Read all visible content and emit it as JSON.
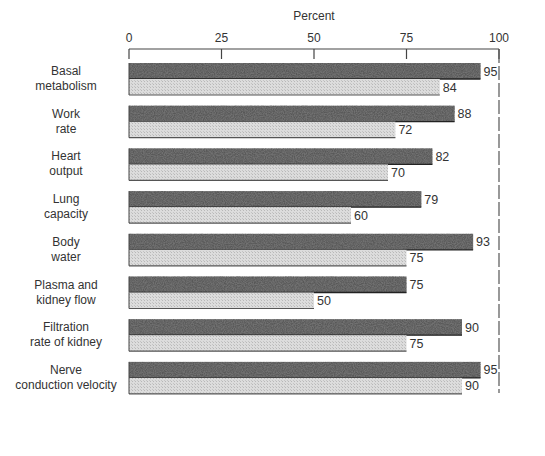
{
  "chart_data": {
    "type": "bar",
    "orientation": "horizontal",
    "title": "",
    "xlabel": "Percent",
    "ylabel": "",
    "xlim": [
      0,
      100
    ],
    "xticks": [
      "0",
      "25",
      "50",
      "75",
      "100"
    ],
    "grid": false,
    "reference_line": {
      "value": 100,
      "style": "dashed"
    },
    "categories": [
      [
        "Basal",
        "metabolism"
      ],
      [
        "Work",
        "rate"
      ],
      [
        "Heart",
        "output"
      ],
      [
        "Lung",
        "capacity"
      ],
      [
        "Body",
        "water"
      ],
      [
        "Plasma and",
        "kidney flow"
      ],
      [
        "Filtration",
        "rate of kidney"
      ],
      [
        "Nerve",
        "conduction velocity"
      ]
    ],
    "series": [
      {
        "name": "dark-stippled",
        "color": "#555555",
        "values": [
          95,
          88,
          82,
          79,
          93,
          75,
          90,
          95
        ]
      },
      {
        "name": "light-hatched",
        "color": "#d4d4d4",
        "values": [
          84,
          72,
          70,
          60,
          75,
          50,
          75,
          90
        ]
      }
    ],
    "value_labels": [
      [
        "95",
        "84"
      ],
      [
        "88",
        "72"
      ],
      [
        "82",
        "70"
      ],
      [
        "79",
        "60"
      ],
      [
        "93",
        "75"
      ],
      [
        "75",
        "50"
      ],
      [
        "90",
        "75"
      ],
      [
        "95",
        "90"
      ]
    ]
  }
}
